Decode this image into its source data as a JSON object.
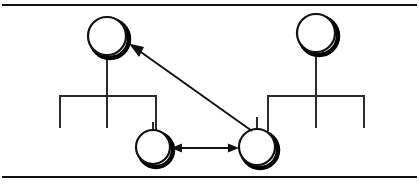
{
  "figure": {
    "type": "kinship-genealogy-diagram",
    "width": 419,
    "height": 185,
    "background_color": "#ffffff",
    "ink_color": "#111111",
    "shadow_color": "#000000"
  },
  "frame": {
    "top_rule": {
      "label": "top-border-rule",
      "x1": 2,
      "y1": 5,
      "x2": 417,
      "y2": 5,
      "width": 2.2
    },
    "bottom_rule": {
      "label": "bottom-border-rule",
      "x1": 2,
      "y1": 177,
      "x2": 417,
      "y2": 177,
      "width": 2.2
    }
  },
  "nodes": [
    {
      "id": "node-top-left",
      "label": "top-left-parent-node",
      "role": "parent",
      "shape": "circle",
      "cx": 107,
      "cy": 36,
      "r": 19,
      "stroke_width": 2.2,
      "has_shadow": true
    },
    {
      "id": "node-top-right",
      "label": "top-right-parent-node",
      "role": "parent",
      "shape": "circle",
      "cx": 316,
      "cy": 33,
      "r": 19,
      "stroke_width": 2.2,
      "has_shadow": true
    },
    {
      "id": "node-bottom-left",
      "label": "bottom-left-child-node",
      "role": "child",
      "shape": "circle",
      "cx": 153,
      "cy": 147,
      "r": 17,
      "stroke_width": 2.2,
      "has_shadow": true
    },
    {
      "id": "node-bottom-right",
      "label": "bottom-right-child-node",
      "role": "child",
      "shape": "circle",
      "cx": 257,
      "cy": 147,
      "r": 18,
      "stroke_width": 2.2,
      "has_shadow": true
    }
  ],
  "trees": [
    {
      "id": "tree-left",
      "label": "left-family-tree",
      "stem": {
        "label": "left-parent-stem",
        "x": 107,
        "y1": 55,
        "y2": 96
      },
      "sibling_bar": {
        "label": "left-sibling-bar",
        "x1": 60,
        "x2": 156,
        "y": 96
      },
      "descenders": [
        {
          "label": "left-tree-descender-left",
          "x": 60,
          "y1": 96,
          "y2": 128
        },
        {
          "label": "left-tree-descender-center",
          "x": 107,
          "y1": 96,
          "y2": 128
        },
        {
          "label": "left-tree-descender-right",
          "x": 156,
          "y1": 96,
          "y2": 130
        }
      ]
    },
    {
      "id": "tree-right",
      "label": "right-family-tree",
      "stem": {
        "label": "right-parent-stem",
        "x": 316,
        "y1": 52,
        "y2": 96
      },
      "sibling_bar": {
        "label": "right-sibling-bar",
        "x1": 268,
        "x2": 364,
        "y": 96
      },
      "descenders": [
        {
          "label": "right-tree-descender-left",
          "x": 268,
          "y1": 96,
          "y2": 130
        },
        {
          "label": "right-tree-descender-center",
          "x": 316,
          "y1": 96,
          "y2": 128
        },
        {
          "label": "right-tree-descender-right",
          "x": 364,
          "y1": 96,
          "y2": 128
        }
      ]
    }
  ],
  "connectors": [
    {
      "id": "connector-child-stem-left",
      "label": "bottom-left-child-stem",
      "type": "line",
      "x1": 153,
      "y1": 122,
      "x2": 153,
      "y2": 130
    },
    {
      "id": "connector-child-stem-right",
      "label": "bottom-right-child-stem",
      "type": "line",
      "x1": 257,
      "y1": 118,
      "x2": 257,
      "y2": 129
    }
  ],
  "arrows": [
    {
      "id": "arrow-sibling-exchange",
      "label": "horizontal-double-arrow",
      "type": "double-headed",
      "from_node": "node-bottom-left",
      "to_node": "node-bottom-right",
      "x1": 172,
      "y1": 148,
      "x2": 238,
      "y2": 148,
      "stroke_width": 2.0,
      "head_length": 9,
      "head_width": 8
    },
    {
      "id": "arrow-diagonal-reference",
      "label": "diagonal-single-arrow",
      "type": "single-headed",
      "from_node": "node-bottom-right",
      "to_node": "node-top-left",
      "x1": 252,
      "y1": 131,
      "x2": 130,
      "y2": 44,
      "stroke_width": 2.0,
      "head_length": 12,
      "head_width": 9
    }
  ]
}
